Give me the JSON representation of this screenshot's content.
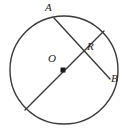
{
  "figure": {
    "kind": "circle-geometry-diagram",
    "background_color": "#ffffff",
    "stroke_color": "#3a3a3a",
    "label_color": "#1c1c1c",
    "labels": {
      "center": "O",
      "chord_endpoint_top": "A",
      "chord_endpoint_right": "B",
      "intersection": "R"
    },
    "circle": {
      "cx": 64,
      "cy": 70,
      "r": 54,
      "stroke_width": 1.4
    },
    "center_dot": {
      "cx": 63,
      "cy": 70,
      "size": 5,
      "shape": "filled-square-dot"
    },
    "segments": [
      {
        "name": "diameter",
        "x1": 104,
        "y1": 31,
        "x2": 25,
        "y2": 110,
        "stroke_width": 1.4
      },
      {
        "name": "chord-AB",
        "x1": 54,
        "y1": 18,
        "x2": 110,
        "y2": 79,
        "stroke_width": 1.4
      }
    ],
    "intersection_point": {
      "name": "R",
      "x": 81,
      "y": 47
    }
  }
}
